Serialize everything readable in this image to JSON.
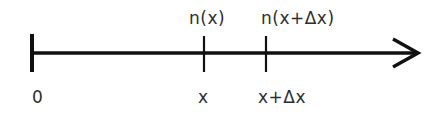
{
  "diagram": {
    "type": "number-line",
    "colors": {
      "line": "#111111",
      "text": "#2e2e2e",
      "background": "#ffffff"
    },
    "axis": {
      "start_label": "0",
      "direction": "right-arrow"
    },
    "points": [
      {
        "id": "x",
        "bottom_label": "x",
        "top_label": "n(x)"
      },
      {
        "id": "x_plus_dx",
        "bottom_label": "x+Δx",
        "top_label": "n(x+Δx)"
      }
    ]
  }
}
